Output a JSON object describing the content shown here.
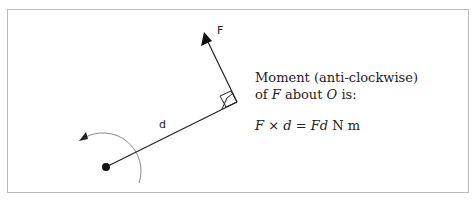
{
  "diagram": {
    "labels": {
      "force": "F",
      "distance": "d"
    },
    "caption": {
      "line1": "Moment (anti-clockwise)",
      "line2_prefix": "of ",
      "line2_force": "F",
      "line2_mid": " about ",
      "line2_point": "O",
      "line2_suffix": " is:",
      "formula_F": "F",
      "formula_times": " × ",
      "formula_d": "d",
      "formula_eq": " = ",
      "formula_Fd": "Fd",
      "formula_units": " N m"
    },
    "colors": {
      "stroke": "#222222",
      "arc": "#888888",
      "border": "#b9b9b9"
    }
  }
}
